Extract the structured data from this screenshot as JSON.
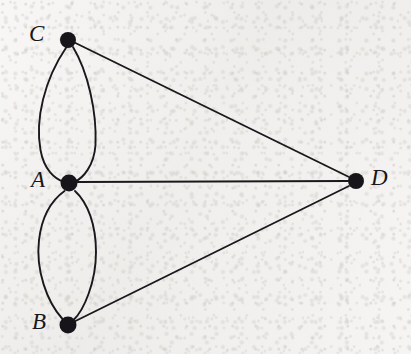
{
  "figure": {
    "name": "multigraph-abcd",
    "background_color": "#f1f0ee",
    "ink_color": "#1a181c",
    "width": 411,
    "height": 354
  },
  "vertices": [
    {
      "id": "C",
      "label": "C",
      "cx": 68,
      "cy": 40,
      "r": 8,
      "label_x": 29,
      "label_y": 22,
      "font_size": 23
    },
    {
      "id": "A",
      "label": "A",
      "cx": 69,
      "cy": 183,
      "r": 8.5,
      "label_x": 31,
      "label_y": 168,
      "font_size": 23
    },
    {
      "id": "B",
      "label": "B",
      "cx": 68,
      "cy": 325,
      "r": 8.5,
      "label_x": 32,
      "label_y": 310,
      "font_size": 23
    },
    {
      "id": "D",
      "label": "D",
      "cx": 356,
      "cy": 181,
      "r": 8,
      "label_x": 371,
      "label_y": 166,
      "font_size": 23
    }
  ],
  "edges": [
    {
      "id": "C-A-left",
      "from": "C",
      "to": "A",
      "kind": "curve",
      "bulge": "left",
      "stroke_width": 1.9
    },
    {
      "id": "C-A-right",
      "from": "C",
      "to": "A",
      "kind": "curve",
      "bulge": "right",
      "stroke_width": 1.9
    },
    {
      "id": "A-B-left",
      "from": "A",
      "to": "B",
      "kind": "curve",
      "bulge": "left",
      "stroke_width": 1.9
    },
    {
      "id": "A-B-right",
      "from": "A",
      "to": "B",
      "kind": "curve",
      "bulge": "right",
      "stroke_width": 1.9
    },
    {
      "id": "C-D",
      "from": "C",
      "to": "D",
      "kind": "straight",
      "stroke_width": 1.9
    },
    {
      "id": "A-D",
      "from": "A",
      "to": "D",
      "kind": "straight",
      "stroke_width": 1.9
    },
    {
      "id": "B-D",
      "from": "B",
      "to": "D",
      "kind": "straight",
      "stroke_width": 1.9
    }
  ],
  "geometry": {
    "ca_left_path": "M 66.5 47 C 44 80, 35 120, 40.5 150 C 44 170, 55 179, 64 182",
    "ca_right_path": "M 73 47 C 88 72, 97 112, 95.5 145 C 94 166, 83 178, 74.5 182",
    "ab_left_path": "M 64.5 191 C 52 200, 42 215, 39 240 C 35.5 270, 47 302, 62.5 319",
    "ab_right_path": "M 75 191 C 88 203, 96 225, 96 252 C 96 282, 84 310, 73.5 320",
    "cd_path": "M 75.5 43 L 349 177",
    "ad_path": "M 77.5 182 L 348 181",
    "bd_path": "M 75.5 321 L 349 186"
  },
  "chart_data": {
    "type": "diagram",
    "title": "",
    "graph_kind": "undirected-multigraph",
    "node_ids": [
      "A",
      "B",
      "C",
      "D"
    ],
    "edge_list": [
      [
        "C",
        "A"
      ],
      [
        "C",
        "A"
      ],
      [
        "A",
        "B"
      ],
      [
        "A",
        "B"
      ],
      [
        "C",
        "D"
      ],
      [
        "A",
        "D"
      ],
      [
        "B",
        "D"
      ]
    ],
    "degrees": {
      "A": 5,
      "B": 3,
      "C": 3,
      "D": 3
    },
    "edge_count": 7,
    "node_count": 4,
    "node_positions": {
      "A": [
        69,
        183
      ],
      "B": [
        68,
        325
      ],
      "C": [
        68,
        40
      ],
      "D": [
        356,
        181
      ]
    }
  }
}
